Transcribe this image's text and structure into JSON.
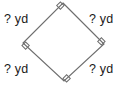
{
  "figure": {
    "shape_name": "rhombus",
    "stroke_color": "#6e6e6e",
    "fill_color": "#ffffff",
    "background_color": "#ffffff",
    "text_color": "#1a1a1a",
    "unit": "yd",
    "vertices": {
      "top": {
        "x": 63,
        "y": 3
      },
      "right": {
        "x": 104,
        "y": 44
      },
      "bottom": {
        "x": 64,
        "y": 81
      },
      "left": {
        "x": 23,
        "y": 43
      }
    },
    "right_angle_markers": [
      "top",
      "right",
      "bottom",
      "left"
    ],
    "labels": {
      "top_left": "? yd",
      "top_right": "? yd",
      "bottom_left": "? yd",
      "bottom_right": "? yd"
    }
  },
  "chart_data": {
    "type": "diagram",
    "title": "",
    "shape": "square rotated 45 degrees (diamond)",
    "sides": [
      {
        "position": "upper-left",
        "length_label": "? yd",
        "known": false
      },
      {
        "position": "upper-right",
        "length_label": "? yd",
        "known": false
      },
      {
        "position": "lower-left",
        "length_label": "? yd",
        "known": false
      },
      {
        "position": "lower-right",
        "length_label": "? yd",
        "known": false
      }
    ],
    "angles": [
      {
        "vertex": "top",
        "marker": "right-angle",
        "degrees": 90
      },
      {
        "vertex": "right",
        "marker": "right-angle",
        "degrees": 90
      },
      {
        "vertex": "bottom",
        "marker": "right-angle",
        "degrees": 90
      },
      {
        "vertex": "left",
        "marker": "right-angle",
        "degrees": 90
      }
    ],
    "units": "yd"
  }
}
